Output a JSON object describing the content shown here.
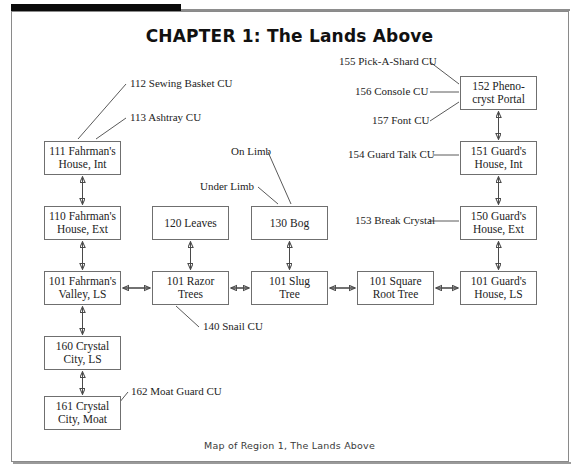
{
  "page": {
    "chapter_title": "CHAPTER 1: The Lands Above",
    "caption": "Map of Region 1, The Lands Above"
  },
  "nodes": [
    {
      "id": "n111",
      "line1": "111 Fahrman's",
      "line2": "House, Int",
      "x": 44,
      "y": 141,
      "w": 77,
      "h": 34
    },
    {
      "id": "n110",
      "line1": "110 Fahrman's",
      "line2": "House, Ext",
      "x": 44,
      "y": 206,
      "w": 77,
      "h": 34
    },
    {
      "id": "n101f",
      "line1": "101 Fahrman's",
      "line2": "Valley, LS",
      "x": 44,
      "y": 271,
      "w": 77,
      "h": 34
    },
    {
      "id": "n160",
      "line1": "160 Crystal",
      "line2": "City, LS",
      "x": 44,
      "y": 336,
      "w": 77,
      "h": 34
    },
    {
      "id": "n161",
      "line1": "161 Crystal",
      "line2": "City, Moat",
      "x": 44,
      "y": 396,
      "w": 77,
      "h": 34
    },
    {
      "id": "n120",
      "line1": "120 Leaves",
      "line2": "",
      "x": 152,
      "y": 206,
      "w": 77,
      "h": 34
    },
    {
      "id": "n101r",
      "line1": "101 Razor",
      "line2": "Trees",
      "x": 152,
      "y": 271,
      "w": 77,
      "h": 34
    },
    {
      "id": "n130",
      "line1": "130 Bog",
      "line2": "",
      "x": 251,
      "y": 206,
      "w": 77,
      "h": 34
    },
    {
      "id": "n101s",
      "line1": "101 Slug",
      "line2": "Tree",
      "x": 251,
      "y": 271,
      "w": 77,
      "h": 34
    },
    {
      "id": "n101q",
      "line1": "101 Square",
      "line2": "Root Tree",
      "x": 357,
      "y": 271,
      "w": 77,
      "h": 34
    },
    {
      "id": "n152",
      "line1": "152 Pheno-",
      "line2": "cryst Portal",
      "x": 460,
      "y": 76,
      "w": 77,
      "h": 34
    },
    {
      "id": "n151",
      "line1": "151 Guard's",
      "line2": "House, Int",
      "x": 460,
      "y": 141,
      "w": 77,
      "h": 34
    },
    {
      "id": "n150",
      "line1": "150 Guard's",
      "line2": "House, Ext",
      "x": 460,
      "y": 206,
      "w": 77,
      "h": 34
    },
    {
      "id": "n101g",
      "line1": "101 Guard's",
      "line2": "House, LS",
      "x": 460,
      "y": 271,
      "w": 77,
      "h": 34
    }
  ],
  "annotations": [
    {
      "id": "a112",
      "text": "112 Sewing Basket CU",
      "x": 130,
      "y": 84,
      "align": "left"
    },
    {
      "id": "a113",
      "text": "113 Ashtray CU",
      "x": 130,
      "y": 116,
      "align": "left"
    },
    {
      "id": "a155",
      "text": "155 Pick-A-Shard CU",
      "x": 339,
      "y": 60,
      "align": "left"
    },
    {
      "id": "a156",
      "text": "156 Console CU",
      "x": 355,
      "y": 89,
      "align": "left"
    },
    {
      "id": "a157",
      "text": "157 Font CU",
      "x": 372,
      "y": 118,
      "align": "left"
    },
    {
      "id": "a154",
      "text": "154 Guard Talk CU",
      "x": 348,
      "y": 152,
      "align": "left"
    },
    {
      "id": "a153",
      "text": "153 Break Crystal",
      "x": 355,
      "y": 217,
      "align": "left"
    },
    {
      "id": "aonl",
      "text": "On Limb",
      "x": 231,
      "y": 148,
      "align": "left"
    },
    {
      "id": "aund",
      "text": "Under Limb",
      "x": 200,
      "y": 183,
      "align": "left"
    },
    {
      "id": "a140",
      "text": "140 Snail CU",
      "x": 203,
      "y": 326,
      "align": "left"
    },
    {
      "id": "a162",
      "text": "162 Moat Guard CU",
      "x": 131,
      "y": 391,
      "align": "left"
    }
  ],
  "connectors": {
    "vertical_double": [
      {
        "from": "n111",
        "to": "n110"
      },
      {
        "from": "n110",
        "to": "n101f"
      },
      {
        "from": "n101f",
        "to": "n160"
      },
      {
        "from": "n160",
        "to": "n161"
      },
      {
        "from": "n120",
        "to": "n101r"
      },
      {
        "from": "n130",
        "to": "n101s"
      },
      {
        "from": "n152",
        "to": "n151"
      },
      {
        "from": "n151",
        "to": "n150"
      },
      {
        "from": "n150",
        "to": "n101g"
      }
    ],
    "horizontal_double": [
      {
        "from": "n101f",
        "to": "n101r"
      },
      {
        "from": "n101r",
        "to": "n101s"
      },
      {
        "from": "n101s",
        "to": "n101q"
      },
      {
        "from": "n101q",
        "to": "n101g"
      }
    ],
    "leaders": [
      "112 Sewing Basket CU -> 111 Fahrman's House, Int",
      "113 Ashtray CU -> 111 Fahrman's House, Int",
      "155 Pick-A-Shard CU -> 152 Pheno-cryst Portal",
      "156 Console CU -> 152 Pheno-cryst Portal",
      "157 Font CU -> 152 Pheno-cryst Portal",
      "154 Guard Talk CU -> 151 Guard's House, Int",
      "153 Break Crystal -> 150 Guard's House, Ext",
      "On Limb -> 130 Bog",
      "Under Limb -> 130 Bog",
      "140 Snail CU -> 101 Razor Trees",
      "162 Moat Guard CU -> 161 Crystal City, Moat"
    ]
  },
  "colors": {
    "ink": "#232323",
    "rule": "#6f6f6f",
    "bar": "#0b0b0b",
    "paper": "#ffffff"
  }
}
